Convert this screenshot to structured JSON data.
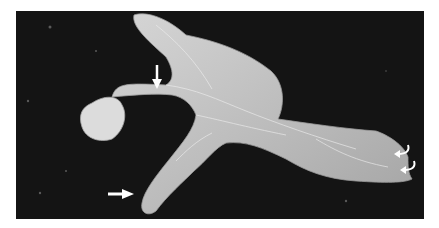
{
  "image": {
    "subject": "gross specimen on dark background",
    "background_color": "#141414",
    "specimen_color": "#c8c8c8",
    "annotations": [
      {
        "type": "arrow",
        "direction": "down",
        "color": "#ffffff"
      },
      {
        "type": "arrow",
        "direction": "right",
        "color": "#ffffff"
      },
      {
        "type": "curved-arrow",
        "direction": "left",
        "color": "#ffffff"
      },
      {
        "type": "curved-arrow",
        "direction": "left",
        "color": "#ffffff"
      }
    ]
  }
}
